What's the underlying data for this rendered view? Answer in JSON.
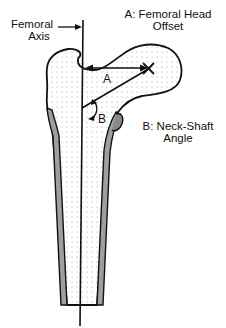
{
  "figure": {
    "labels": {
      "femoral_axis_line1": "Femoral",
      "femoral_axis_line2": "Axis",
      "offset_line1": "A: Femoral Head",
      "offset_line2": "Offset",
      "angle_line1": "B: Neck-Shaft",
      "angle_line2": "Angle",
      "marker_a": "A",
      "marker_b": "B"
    },
    "colors": {
      "outline": "#111111",
      "stipple": "#9a9a9a",
      "cortex_hatch": "#7a7a7a",
      "background": "#ffffff"
    }
  }
}
